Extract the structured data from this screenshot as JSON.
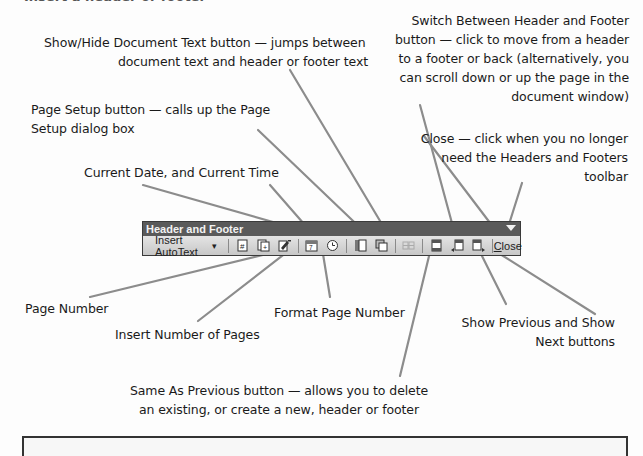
{
  "cut_heading": "Insert a header or footer",
  "annotations": {
    "show_hide": [
      "Show/Hide Document Text button — jumps between",
      "document text and header or footer text"
    ],
    "switch": [
      "Switch Between Header and Footer",
      "button — click to move from a header",
      "to a footer or back (alternatively, you",
      "can scroll down or up the page in the",
      "document window)"
    ],
    "page_setup": [
      "Page Setup button — calls up the Page",
      "Setup dialog box"
    ],
    "date_time": [
      "Current Date, and Current Time"
    ],
    "close": [
      "Close — click when you no longer",
      "need the Headers and Footers",
      "toolbar"
    ],
    "page_number": [
      "Page Number"
    ],
    "num_pages": [
      "Insert Number of Pages"
    ],
    "format_page": [
      "Format Page Number"
    ],
    "prev_next": [
      "Show Previous and Show",
      "Next buttons"
    ],
    "same_as_prev": [
      "Same As Previous button — allows you to delete",
      "an existing, or create a new, header or footer"
    ]
  },
  "toolbar": {
    "title": "Header and Footer",
    "insert_autotext": "Insert AutoText",
    "dropdown_glyph": "▾",
    "close_label_first": "C",
    "close_label_rest": "lose",
    "buttons": [
      {
        "name": "insert-page-number",
        "icon": "page-number-icon"
      },
      {
        "name": "insert-number-of-pages",
        "icon": "number-of-pages-icon"
      },
      {
        "name": "format-page-number",
        "icon": "format-page-number-icon"
      },
      {
        "name": "insert-date",
        "icon": "date-icon"
      },
      {
        "name": "insert-time",
        "icon": "clock-icon"
      },
      {
        "name": "page-setup",
        "icon": "page-setup-icon"
      },
      {
        "name": "show-hide-document-text",
        "icon": "show-hide-document-icon"
      },
      {
        "name": "same-as-previous",
        "icon": "same-as-previous-icon",
        "disabled": true
      },
      {
        "name": "switch-header-footer",
        "icon": "switch-header-footer-icon"
      },
      {
        "name": "show-previous",
        "icon": "show-previous-icon"
      },
      {
        "name": "show-next",
        "icon": "show-next-icon"
      }
    ]
  },
  "colors": {
    "toolbar_title_bg": "#5a5a5a",
    "toolbar_bg": "#cfcfcf",
    "leader_lines": "#8c8c8c",
    "text": "#1a1a1a"
  }
}
